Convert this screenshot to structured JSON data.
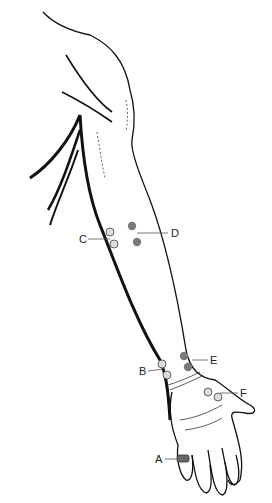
{
  "figure": {
    "colors": {
      "line": "#111111",
      "filled_point": "#7a7a7a",
      "open_point_fill": "#dcdcdc",
      "open_point_stroke": "#555555",
      "leader": "#555555"
    }
  },
  "labels": {
    "A": "A",
    "B": "B",
    "C": "C",
    "D": "D",
    "E": "E",
    "F": "F"
  },
  "points": [
    {
      "label": "A",
      "type": "band",
      "desc": "ring on finger"
    },
    {
      "label": "B",
      "type": "open",
      "count": 2
    },
    {
      "label": "C",
      "type": "open",
      "count": 2
    },
    {
      "label": "D",
      "type": "filled",
      "count": 2
    },
    {
      "label": "E",
      "type": "filled",
      "count": 2
    },
    {
      "label": "F",
      "type": "open",
      "count": 2
    }
  ]
}
